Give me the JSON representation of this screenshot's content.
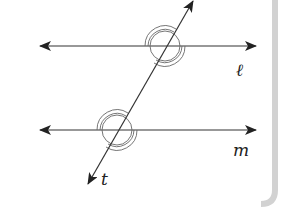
{
  "diagram": {
    "lines": [
      {
        "id": "l",
        "label": "ℓ",
        "y": 46,
        "x1": 40,
        "x2": 256
      },
      {
        "id": "m",
        "label": "m",
        "y": 130,
        "x1": 40,
        "x2": 256
      }
    ],
    "transversal": {
      "id": "t",
      "label": "t",
      "x1": 193,
      "y1": 0,
      "x2": 87,
      "y2": 185
    },
    "intersections": [
      {
        "of": [
          "t",
          "l"
        ],
        "x": 165,
        "y": 46
      },
      {
        "of": [
          "t",
          "m"
        ],
        "x": 117,
        "y": 130
      }
    ],
    "colors": {
      "stroke": "#222222",
      "arc": "#555555",
      "frame": "#cfcfcf"
    }
  }
}
